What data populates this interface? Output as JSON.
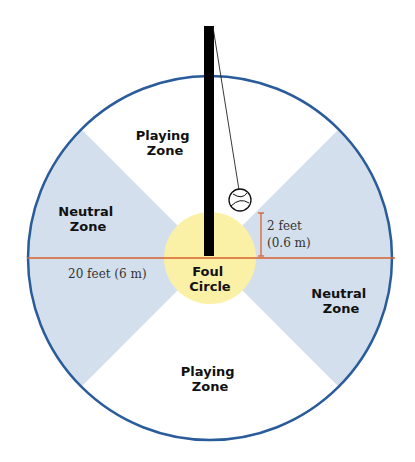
{
  "diagram": {
    "colors": {
      "background": "#ffffff",
      "court_outline": "#2a5b9a",
      "neutral_zone": "#d3dfec",
      "playing_zone": "#ffffff",
      "foul_circle": "#fbf1a6",
      "measure_line": "#d8612f",
      "pole": "#000000"
    },
    "zones": {
      "playing_top": {
        "line1": "Playing",
        "line2": "Zone"
      },
      "playing_bottom": {
        "line1": "Playing",
        "line2": "Zone"
      },
      "neutral_left": {
        "line1": "Neutral",
        "line2": "Zone"
      },
      "neutral_right": {
        "line1": "Neutral",
        "line2": "Zone"
      },
      "foul_circle": {
        "line1": "Foul",
        "line2": "Circle"
      }
    },
    "measurements": {
      "diameter": "20 feet (6 m)",
      "ball_height_line1": "2 feet",
      "ball_height_line2": "(0.6 m)"
    }
  }
}
